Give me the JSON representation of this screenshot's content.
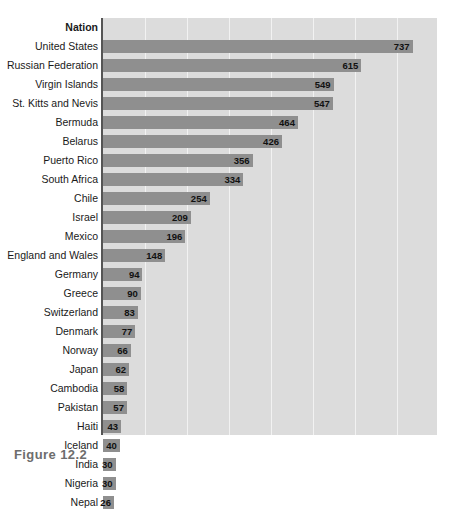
{
  "chart_data": {
    "type": "bar",
    "orientation": "horizontal",
    "title": "",
    "xlabel": "",
    "ylabel": "Nation",
    "column_header": "Nation",
    "xlim": [
      0,
      795
    ],
    "grid": true,
    "gridlines": [
      100,
      200,
      300,
      400,
      500,
      600,
      700
    ],
    "legend": "none",
    "categories": [
      "United States",
      "Russian Federation",
      "Virgin Islands",
      "St. Kitts and Nevis",
      "Bermuda",
      "Belarus",
      "Puerto Rico",
      "South Africa",
      "Chile",
      "Israel",
      "Mexico",
      "England and Wales",
      "Germany",
      "Greece",
      "Switzerland",
      "Denmark",
      "Norway",
      "Japan",
      "Cambodia",
      "Pakistan",
      "Haiti",
      "Iceland",
      "India",
      "Nigeria",
      "Nepal"
    ],
    "values": [
      737,
      615,
      549,
      547,
      464,
      426,
      356,
      334,
      254,
      209,
      196,
      148,
      94,
      90,
      83,
      77,
      66,
      62,
      58,
      57,
      43,
      40,
      30,
      30,
      26
    ],
    "bar_color": "#8f8f8f",
    "plot_background": "#dcdcdc",
    "gridline_color": "#f2f2f2",
    "axis_color": "#555555"
  },
  "caption": {
    "text": "Figure 12.2"
  }
}
